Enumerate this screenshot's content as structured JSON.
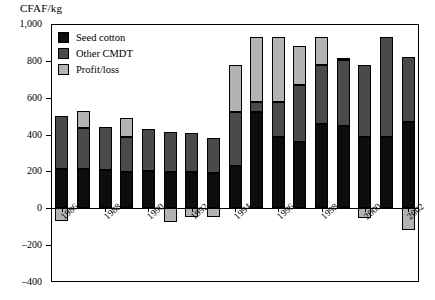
{
  "axis": {
    "ylabel": "CFAF/kg",
    "yticks": [
      "1,000",
      "800",
      "600",
      "400",
      "200",
      "0",
      "–200",
      "–400"
    ],
    "xticks": [
      "1986",
      "1988",
      "1990",
      "1992",
      "1994",
      "1996",
      "1998",
      "2000",
      "2002"
    ]
  },
  "legend": {
    "items": [
      {
        "label": "Seed cotton",
        "color": "#0d0d0d"
      },
      {
        "label": "Other CMDT",
        "color": "#4a4a4a"
      },
      {
        "label": "Profit/loss",
        "color": "#b3b3b3"
      }
    ]
  },
  "chart_data": {
    "type": "bar",
    "subtype": "stacked",
    "title": "",
    "xlabel": "",
    "ylabel": "CFAF/kg",
    "ylim": [
      -400,
      1000
    ],
    "grid": false,
    "legend_position": "top-left inside plot",
    "categories": [
      "1986",
      "1987",
      "1988",
      "1989",
      "1990",
      "1991",
      "1992",
      "1993",
      "1994",
      "1995",
      "1996",
      "1997",
      "1998",
      "1999",
      "2000",
      "2001",
      "2002"
    ],
    "series": [
      {
        "name": "Seed cotton",
        "color": "#0d0d0d",
        "values": [
          215,
          215,
          210,
          195,
          200,
          195,
          195,
          190,
          230,
          520,
          385,
          360,
          455,
          445,
          385,
          385,
          470
        ]
      },
      {
        "name": "Other CMDT",
        "color": "#4a4a4a",
        "values": [
          285,
          220,
          230,
          190,
          230,
          220,
          215,
          190,
          295,
          55,
          190,
          310,
          325,
          360,
          390,
          545,
          350
        ]
      },
      {
        "name": "Profit/loss",
        "color": "#b3b3b3",
        "values": [
          -70,
          95,
          0,
          105,
          0,
          -75,
          -45,
          -50,
          250,
          355,
          355,
          210,
          150,
          10,
          -55,
          0,
          -120
        ]
      }
    ],
    "stack_tops": [
      500,
      435,
      440,
      490,
      430,
      415,
      410,
      380,
      775,
      930,
      930,
      880,
      930,
      815,
      775,
      930,
      820
    ]
  }
}
